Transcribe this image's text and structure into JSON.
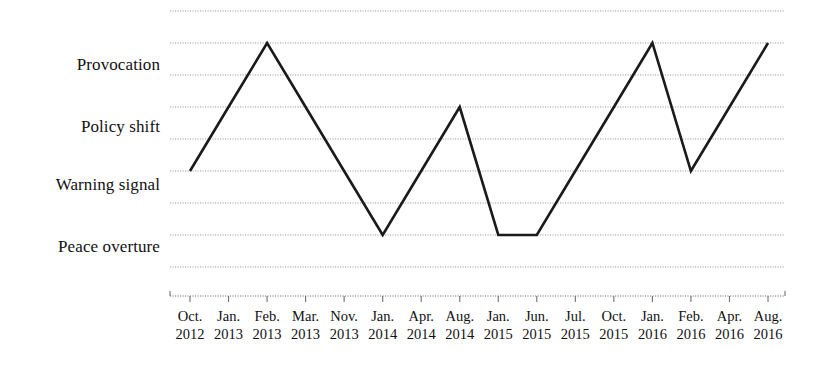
{
  "chart_data": {
    "type": "line",
    "title": "",
    "xlabel": "",
    "ylabel": "",
    "grid": true,
    "legend": null,
    "y_categories": [
      "Peace overture",
      "Warning signal",
      "Policy shift",
      "Provocation"
    ],
    "y_category_levels": [
      1,
      3,
      5,
      7
    ],
    "ylim": [
      0,
      8
    ],
    "gridline_levels": [
      8,
      7,
      6,
      5,
      4,
      3,
      2,
      1,
      0
    ],
    "categories": [
      "Oct. 2012",
      "Jan. 2013",
      "Feb. 2013",
      "Mar. 2013",
      "Nov. 2013",
      "Jan. 2014",
      "Apr. 2014",
      "Aug. 2014",
      "Jan. 2015",
      "Jun. 2015",
      "Jul. 2015",
      "Oct. 2015",
      "Jan. 2016",
      "Feb. 2016",
      "Apr. 2016",
      "Aug. 2016"
    ],
    "x_ticks": [
      {
        "month": "Oct.",
        "year": "2012"
      },
      {
        "month": "Jan.",
        "year": "2013"
      },
      {
        "month": "Feb.",
        "year": "2013"
      },
      {
        "month": "Mar.",
        "year": "2013"
      },
      {
        "month": "Nov.",
        "year": "2013"
      },
      {
        "month": "Jan.",
        "year": "2014"
      },
      {
        "month": "Apr.",
        "year": "2014"
      },
      {
        "month": "Aug.",
        "year": "2014"
      },
      {
        "month": "Jan.",
        "year": "2015"
      },
      {
        "month": "Jun.",
        "year": "2015"
      },
      {
        "month": "Jul.",
        "year": "2015"
      },
      {
        "month": "Oct.",
        "year": "2015"
      },
      {
        "month": "Jan.",
        "year": "2016"
      },
      {
        "month": "Feb.",
        "year": "2016"
      },
      {
        "month": "Apr.",
        "year": "2016"
      },
      {
        "month": "Aug.",
        "year": "2016"
      }
    ],
    "values": [
      3,
      5,
      7,
      5,
      3,
      1,
      3,
      5,
      1,
      1,
      3,
      5,
      7,
      3,
      5,
      7
    ],
    "series": [
      {
        "name": "Event escalation level",
        "color": "#1a1a1a",
        "values": [
          3,
          5,
          7,
          5,
          3,
          1,
          3,
          5,
          1,
          1,
          3,
          5,
          7,
          3,
          5,
          7
        ]
      }
    ],
    "colors": {
      "line": "#1a1a1a",
      "grid": "#9a9a9a",
      "axis": "#6f6f6f",
      "text": "#111111",
      "background": "#ffffff"
    }
  }
}
